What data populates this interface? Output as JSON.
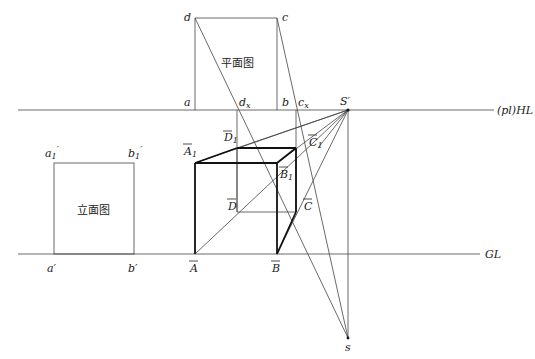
{
  "diagram": {
    "plan_label": "平面图",
    "elevation_label": "立面图",
    "lines": {
      "horizon_label": "(pl)HL",
      "ground_label": "GL"
    },
    "plan_points": {
      "a": "a",
      "b": "b",
      "c": "c",
      "d": "d",
      "dx": "d",
      "dx_sub": "x",
      "cx": "c",
      "cx_sub": "x"
    },
    "elevation_points": {
      "a1p": "a",
      "a1p_sub": "1",
      "b1p": "b",
      "b1p_sub": "1",
      "ap": "a′",
      "bp": "b′"
    },
    "station": {
      "S_prime": "S′",
      "s": "s"
    },
    "cube_points": {
      "A": "A",
      "B": "B",
      "C": "C",
      "D": "D",
      "A1": "A",
      "B1": "B",
      "C1": "C",
      "D1": "D",
      "sub1": "1"
    }
  }
}
